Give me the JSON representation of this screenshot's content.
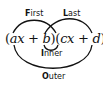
{
  "diagram": {
    "labels": {
      "first": {
        "initial": "F",
        "rest": "irst"
      },
      "last": {
        "initial": "L",
        "rest": "ast"
      },
      "inner": {
        "initial": "I",
        "rest": "nner"
      },
      "outer": {
        "initial": "O",
        "rest": "uter"
      }
    },
    "expression": {
      "open1": "(",
      "a": "a",
      "x1": "x",
      "plus1": " + ",
      "b": "b",
      "close_open": ")(",
      "c": "c",
      "x2": "x",
      "plus2": " + ",
      "d": "d",
      "close2": ")"
    },
    "colors": {
      "stroke": "#111111",
      "text": "#111111"
    }
  }
}
